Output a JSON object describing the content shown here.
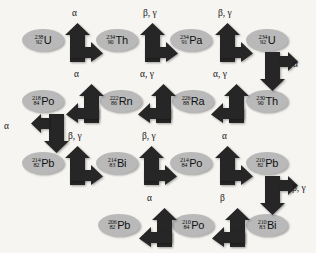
{
  "diagram": {
    "background_color": "#f7f5f2",
    "nuclide_color": "#b9b9b9",
    "arrow_color": "#262626"
  },
  "nuclides": [
    {
      "id": "u238",
      "mass": "238",
      "atomic": "92",
      "symbol": "U",
      "x": 22,
      "y": 29
    },
    {
      "id": "th234",
      "mass": "234",
      "atomic": "90",
      "symbol": "Th",
      "x": 96,
      "y": 29
    },
    {
      "id": "pa234",
      "mass": "234",
      "atomic": "91",
      "symbol": "Pa",
      "x": 170,
      "y": 29
    },
    {
      "id": "u234",
      "mass": "234",
      "atomic": "92",
      "symbol": "U",
      "x": 246,
      "y": 29
    },
    {
      "id": "th230",
      "mass": "230",
      "atomic": "90",
      "symbol": "Th",
      "x": 246,
      "y": 90
    },
    {
      "id": "ra226",
      "mass": "226",
      "atomic": "88",
      "symbol": "Ra",
      "x": 172,
      "y": 90
    },
    {
      "id": "rn222",
      "mass": "222",
      "atomic": "86",
      "symbol": "Rn",
      "x": 100,
      "y": 90
    },
    {
      "id": "po218",
      "mass": "218",
      "atomic": "84",
      "symbol": "Po",
      "x": 22,
      "y": 90
    },
    {
      "id": "pb214",
      "mass": "214",
      "atomic": "82",
      "symbol": "Pb",
      "x": 22,
      "y": 152
    },
    {
      "id": "bi214",
      "mass": "214",
      "atomic": "83",
      "symbol": "Bi",
      "x": 96,
      "y": 152
    },
    {
      "id": "po214",
      "mass": "214",
      "atomic": "84",
      "symbol": "Po",
      "x": 170,
      "y": 152
    },
    {
      "id": "pb210",
      "mass": "210",
      "atomic": "82",
      "symbol": "Pb",
      "x": 246,
      "y": 152
    },
    {
      "id": "bi210",
      "mass": "210",
      "atomic": "83",
      "symbol": "Bi",
      "x": 246,
      "y": 214
    },
    {
      "id": "po210",
      "mass": "210",
      "atomic": "84",
      "symbol": "Po",
      "x": 172,
      "y": 214
    },
    {
      "id": "pb206",
      "mass": "206",
      "atomic": "82",
      "symbol": "Pb",
      "x": 98,
      "y": 214
    }
  ],
  "arrows": [
    {
      "id": "a1",
      "kind": "up-right",
      "x": 64,
      "y": 22,
      "label": "α",
      "label_x": 72,
      "label_y": 8
    },
    {
      "id": "a2",
      "kind": "up-right",
      "x": 139,
      "y": 22,
      "label": "β, γ",
      "label_x": 143,
      "label_y": 8
    },
    {
      "id": "a3",
      "kind": "up-right",
      "x": 214,
      "y": 22,
      "label": "β, γ",
      "label_x": 218,
      "label_y": 8
    },
    {
      "id": "a4",
      "kind": "down-right",
      "x": 259,
      "y": 52,
      "label": "α",
      "label_x": 293,
      "label_y": 59
    },
    {
      "id": "a5",
      "kind": "up-left",
      "x": 210,
      "y": 83,
      "label": "α, γ",
      "label_x": 213,
      "label_y": 69
    },
    {
      "id": "a6",
      "kind": "up-left",
      "x": 137,
      "y": 83,
      "label": "α, γ",
      "label_x": 140,
      "label_y": 69
    },
    {
      "id": "a7",
      "kind": "up-left",
      "x": 65,
      "y": 83,
      "label": "α",
      "label_x": 74,
      "label_y": 69
    },
    {
      "id": "a8",
      "kind": "down-left",
      "x": 30,
      "y": 114,
      "label": "α",
      "label_x": 4,
      "label_y": 121
    },
    {
      "id": "a9",
      "kind": "up-right",
      "x": 64,
      "y": 145,
      "label": "β, γ",
      "label_x": 68,
      "label_y": 131
    },
    {
      "id": "a10",
      "kind": "up-right",
      "x": 138,
      "y": 145,
      "label": "β, γ",
      "label_x": 142,
      "label_y": 131
    },
    {
      "id": "a11",
      "kind": "up-right",
      "x": 214,
      "y": 145,
      "label": "α",
      "label_x": 222,
      "label_y": 131
    },
    {
      "id": "a12",
      "kind": "down-right",
      "x": 259,
      "y": 176,
      "label": "β, γ",
      "label_x": 292,
      "label_y": 183
    },
    {
      "id": "a13",
      "kind": "up-left",
      "x": 211,
      "y": 207,
      "label": "β",
      "label_x": 220,
      "label_y": 193
    },
    {
      "id": "a14",
      "kind": "up-left",
      "x": 138,
      "y": 207,
      "label": "α",
      "label_x": 147,
      "label_y": 193
    }
  ]
}
